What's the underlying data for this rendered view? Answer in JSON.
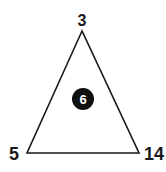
{
  "puzzle": {
    "shape": "triangle",
    "vertices": {
      "top": "3",
      "bottom_left": "5",
      "bottom_right": "14"
    },
    "center": "6",
    "colors": {
      "line": "#1a1a1a",
      "circle_fill": "#111111",
      "circle_text": "#ffffff",
      "background": "#ffffff"
    }
  }
}
